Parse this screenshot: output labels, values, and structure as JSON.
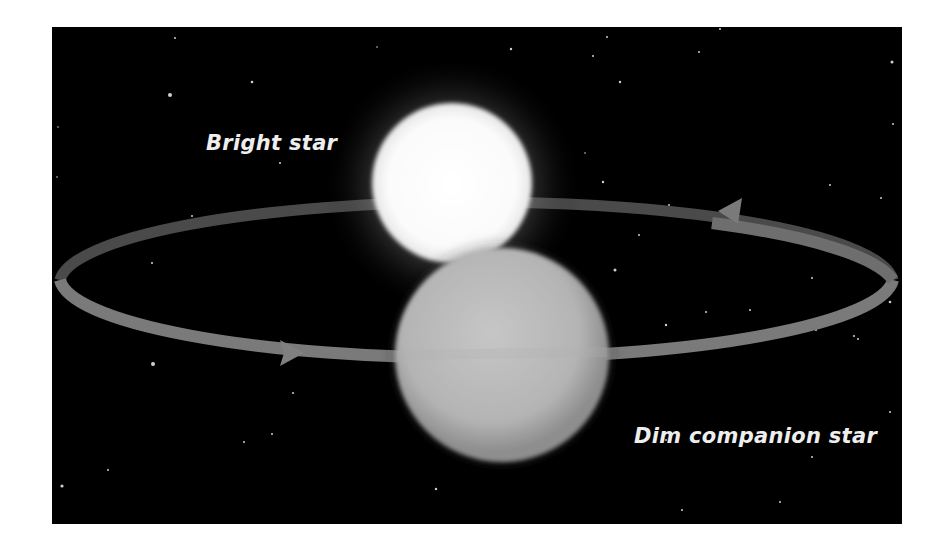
{
  "figure": {
    "type": "binary-star-orbit-illustration",
    "background_color": "#000000",
    "page_color": "#ffffff"
  },
  "labels": {
    "bright_star": "Bright star",
    "dim_star": "Dim companion star"
  },
  "objects": {
    "bright_star": {
      "color": "#ffffff",
      "glow_color": "#9a9a9a"
    },
    "dim_star": {
      "color": "#bdbdbd",
      "edge_color": "#8a8a8a"
    },
    "orbit": {
      "color": "#7a7a7a",
      "direction": "counterclockwise-as-viewed"
    },
    "arrows": [
      {
        "position": "front-left",
        "points": "right"
      },
      {
        "position": "back-right",
        "points": "left"
      }
    ]
  },
  "colors": {
    "label_text": "#eeeeee",
    "orbit": "#7a7a7a"
  }
}
